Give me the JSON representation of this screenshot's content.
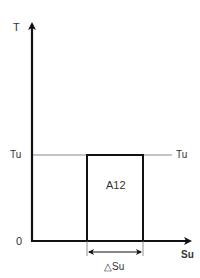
{
  "diagram": {
    "y_axis_label": "T",
    "x_axis_label": "Su",
    "origin_label": "0",
    "threshold_label_left": "Tu",
    "threshold_label_right": "Tu",
    "area_label": "A12",
    "width_label": "△Su",
    "colors": {
      "axis": "#111111",
      "threshold_line": "#888888",
      "rectangle": "#111111",
      "text": "#333333"
    }
  }
}
